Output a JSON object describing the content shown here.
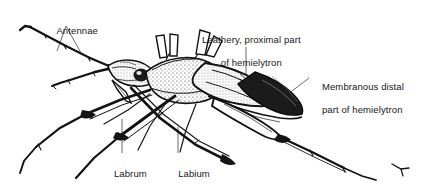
{
  "figure": {
    "kind": "scientific-line-drawing",
    "background_color": "#ffffff",
    "ink_color": "#111111",
    "leader_line_color": "#555555",
    "width": 425,
    "height": 187
  },
  "labels": {
    "antennae": {
      "text": "Antennae",
      "line1": "Antennae"
    },
    "leathery": {
      "text": "Leathery, proximal part of hemielytron",
      "line1": "Leathery, proximal part",
      "line2": "of hemielytron"
    },
    "membranous": {
      "text": "Membranous distal part of hemielytron",
      "line1": "Membranous distal",
      "line2": "part of hemielytron"
    },
    "labrum": {
      "text": "Labrum",
      "line1": "Labrum"
    },
    "labium": {
      "text": "Labium (proboscis)",
      "line1": "Labium",
      "line2": "(proboscis)"
    }
  }
}
